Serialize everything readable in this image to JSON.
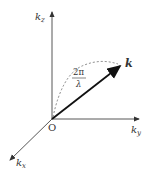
{
  "diagram": {
    "axes": {
      "z": {
        "label": "k",
        "sub": "z"
      },
      "y": {
        "label": "k",
        "sub": "y"
      },
      "x": {
        "label": "k",
        "sub": "x"
      }
    },
    "origin_label": "O",
    "vector_label": "k",
    "magnitude": {
      "numerator": "2π",
      "denominator": "λ"
    },
    "colors": {
      "axis": "#444444",
      "vector": "#111111",
      "dashed": "#555555"
    }
  }
}
